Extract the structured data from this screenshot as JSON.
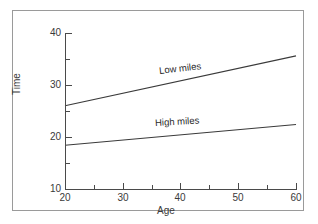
{
  "chart_data": {
    "type": "line",
    "title": "",
    "xlabel": "Age",
    "ylabel": "Time",
    "xlim": [
      20,
      60
    ],
    "ylim": [
      10,
      40
    ],
    "grid": false,
    "legend_position": "inline-labels",
    "x_major_ticks": [
      20,
      30,
      40,
      50,
      60
    ],
    "x_minor_ticks": [
      25,
      35,
      45,
      55
    ],
    "y_major_ticks": [
      10,
      20,
      30,
      40
    ],
    "y_minor_ticks": [
      15,
      25,
      35
    ],
    "x_tick_labels": [
      "20",
      "30",
      "40",
      "50",
      "60"
    ],
    "y_tick_labels": [
      "10",
      "20",
      "30",
      "40"
    ],
    "series": [
      {
        "name": "Low miles",
        "x": [
          20,
          60
        ],
        "values": [
          26.0,
          35.6
        ],
        "color": "#3a3a3a"
      },
      {
        "name": "High miles",
        "x": [
          20,
          60
        ],
        "values": [
          18.4,
          22.4
        ],
        "color": "#3a3a3a"
      }
    ]
  },
  "axes": {
    "y_label": "Time",
    "x_label": "Age",
    "y_ticks": [
      {
        "label": "40"
      },
      {
        "label": "30"
      },
      {
        "label": "20"
      },
      {
        "label": "10"
      }
    ],
    "x_ticks": [
      {
        "label": "20"
      },
      {
        "label": "30"
      },
      {
        "label": "40"
      },
      {
        "label": "50"
      },
      {
        "label": "60"
      }
    ]
  },
  "annotations": {
    "low_miles": "Low miles",
    "high_miles": "High miles"
  },
  "colors": {
    "line": "#3a3a3a",
    "axis": "#4a4a4a",
    "frame": "#9a9a9a",
    "background": "#ffffff",
    "text": "#3a3a3a"
  }
}
